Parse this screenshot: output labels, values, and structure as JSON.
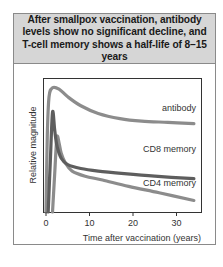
{
  "title": "After smallpox vaccination, antibody levels show no significant decline, and T-cell memory shows a half-life of 8–15 years",
  "chart_data": {
    "type": "line",
    "title": "After smallpox vaccination, antibody levels show no significant decline, and T-cell memory shows a half-life of 8–15 years",
    "xlabel": "Time after vaccination (years)",
    "ylabel": "Relative magnitude",
    "xlim": [
      -1,
      35.5
    ],
    "ylim": [
      0,
      1
    ],
    "xticks": [
      0,
      10,
      20,
      30
    ],
    "xtick_labels": [
      "0",
      "10",
      "20",
      "30"
    ],
    "yticks": [],
    "grid": false,
    "legend": "inline labels at right end of each curve",
    "series": [
      {
        "name": "antibody",
        "label": "antibody",
        "color": "#8c8c8c",
        "x": [
          0,
          0.3,
          0.7,
          1.5,
          3,
          5,
          8,
          12,
          17,
          22,
          28,
          34
        ],
        "y": [
          0.0,
          0.6,
          0.9,
          0.97,
          0.96,
          0.9,
          0.83,
          0.77,
          0.73,
          0.71,
          0.7,
          0.69
        ]
      },
      {
        "name": "CD8 memory",
        "label": "CD8 memory",
        "color": "#5e5e5e",
        "x": [
          0.5,
          1.0,
          1.5,
          2.0,
          2.5,
          3.5,
          5,
          8,
          12,
          18,
          25,
          34
        ],
        "y": [
          0.0,
          0.4,
          0.78,
          0.64,
          0.52,
          0.42,
          0.37,
          0.34,
          0.32,
          0.3,
          0.28,
          0.26
        ]
      },
      {
        "name": "CD4 memory",
        "label": "CD4 memory",
        "color": "#8c8c8c",
        "x": [
          1.5,
          2.0,
          2.5,
          3.0,
          3.5,
          4.5,
          6,
          9,
          13,
          19,
          26,
          34
        ],
        "y": [
          0.0,
          0.3,
          0.58,
          0.54,
          0.46,
          0.38,
          0.32,
          0.28,
          0.25,
          0.2,
          0.15,
          0.09
        ]
      }
    ]
  },
  "axis": {
    "ylabel": "Relative magnitude",
    "xlabel": "Time after vaccination (years)",
    "xtick_labels": [
      "0",
      "10",
      "20",
      "30"
    ]
  },
  "labels": {
    "antibody": "antibody",
    "cd8": "CD8 memory",
    "cd4": "CD4 memory"
  }
}
